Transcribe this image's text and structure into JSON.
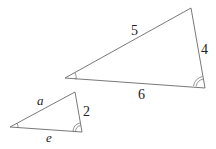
{
  "diagram": {
    "title": "",
    "large_triangle": {
      "vertices": {
        "left": [
          65,
          78
        ],
        "top": [
          191,
          8
        ],
        "right": [
          205,
          88
        ]
      },
      "labels": {
        "hypotenuse": "5",
        "right_side": "4",
        "base": "6"
      },
      "angle_marks": {
        "left": "single",
        "right": "double"
      }
    },
    "small_triangle": {
      "vertices": {
        "left": [
          10,
          127
        ],
        "top": [
          75,
          92
        ],
        "right": [
          82,
          132
        ]
      },
      "labels": {
        "hypotenuse": "a",
        "right_side": "2",
        "base": "e"
      },
      "angle_marks": {
        "left": "single",
        "right": "double"
      }
    }
  }
}
